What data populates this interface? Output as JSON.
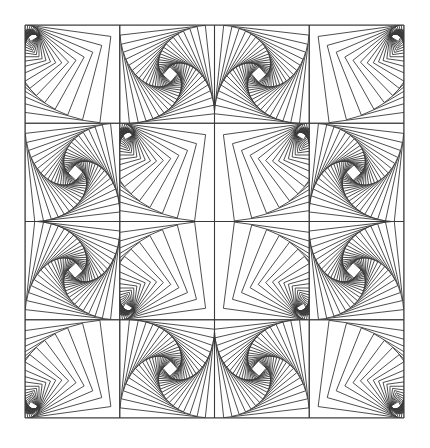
{
  "artwork": {
    "title": "Twisted squares quilt pattern",
    "background_color": "#ffffff",
    "line_color": "#3a3a3a",
    "line_width": 0.9,
    "frame": {
      "x": 25,
      "y": 25,
      "width": 379,
      "height": 393
    },
    "grid": {
      "rows": 4,
      "cols": 4
    },
    "motifs": {
      "fan": {
        "pivot": [
          0.12,
          0.12
        ],
        "rotation_deg": 7.5,
        "scale": 0.885,
        "iterations": 20
      },
      "spiral": {
        "pivot": [
          0.53,
          0.5
        ],
        "rotation_deg": -6.3,
        "scale": 0.905,
        "iterations": 22
      }
    },
    "cells": [
      [
        "fan",
        "spiral",
        "spiral",
        "fan"
      ],
      [
        "spiral",
        "fan",
        "fan",
        "spiral"
      ],
      [
        "spiral",
        "fan",
        "fan",
        "spiral"
      ],
      [
        "fan",
        "spiral",
        "spiral",
        "fan"
      ]
    ]
  }
}
